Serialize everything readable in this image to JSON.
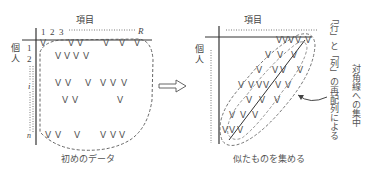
{
  "left_panel": {
    "column_axis_label": "項目",
    "row_axis_label_1": "個",
    "row_axis_label_2": "人",
    "column_numbers": [
      "1",
      "2",
      "3"
    ],
    "column_end": "R",
    "row_numbers": [
      "1",
      "2"
    ],
    "row_mid": "i",
    "row_end": "n",
    "caption": "初めのデータ",
    "marks": [
      {
        "x": 43,
        "y": 44
      },
      {
        "x": 71,
        "y": 44
      },
      {
        "x": 80,
        "y": 44
      },
      {
        "x": 106,
        "y": 44
      },
      {
        "x": 122,
        "y": 44
      },
      {
        "x": 137,
        "y": 44
      },
      {
        "x": 58,
        "y": 57
      },
      {
        "x": 67,
        "y": 57
      },
      {
        "x": 76,
        "y": 57
      },
      {
        "x": 86,
        "y": 57
      },
      {
        "x": 58,
        "y": 84
      },
      {
        "x": 68,
        "y": 84
      },
      {
        "x": 88,
        "y": 84
      },
      {
        "x": 103,
        "y": 84
      },
      {
        "x": 113,
        "y": 84
      },
      {
        "x": 124,
        "y": 84
      },
      {
        "x": 65,
        "y": 101
      },
      {
        "x": 75,
        "y": 101
      },
      {
        "x": 120,
        "y": 101
      },
      {
        "x": 48,
        "y": 136
      },
      {
        "x": 58,
        "y": 136
      },
      {
        "x": 77,
        "y": 136
      },
      {
        "x": 103,
        "y": 136
      },
      {
        "x": 113,
        "y": 136
      },
      {
        "x": 122,
        "y": 136
      }
    ]
  },
  "right_panel": {
    "column_axis_label": "項目",
    "row_axis_label_1": "個",
    "row_axis_label_2": "人",
    "caption": "似たものを集める",
    "annotation_col1": "「行」と「列」の再配列による",
    "annotation_col2": "対角線への集中",
    "marks": [
      {
        "x": 279,
        "y": 41
      },
      {
        "x": 285,
        "y": 41
      },
      {
        "x": 291,
        "y": 41
      },
      {
        "x": 298,
        "y": 41
      },
      {
        "x": 308,
        "y": 41
      },
      {
        "x": 268,
        "y": 56
      },
      {
        "x": 280,
        "y": 56
      },
      {
        "x": 294,
        "y": 56
      },
      {
        "x": 259,
        "y": 71
      },
      {
        "x": 275,
        "y": 71
      },
      {
        "x": 283,
        "y": 71
      },
      {
        "x": 300,
        "y": 71
      },
      {
        "x": 241,
        "y": 86
      },
      {
        "x": 251,
        "y": 86
      },
      {
        "x": 259,
        "y": 86
      },
      {
        "x": 266,
        "y": 86
      },
      {
        "x": 278,
        "y": 86
      },
      {
        "x": 288,
        "y": 86
      },
      {
        "x": 249,
        "y": 101
      },
      {
        "x": 262,
        "y": 101
      },
      {
        "x": 277,
        "y": 101
      },
      {
        "x": 232,
        "y": 116
      },
      {
        "x": 243,
        "y": 116
      },
      {
        "x": 255,
        "y": 116
      },
      {
        "x": 225,
        "y": 131
      },
      {
        "x": 232,
        "y": 131
      },
      {
        "x": 240,
        "y": 131
      }
    ]
  },
  "mark_glyph": "V",
  "arrow": "double-outline-right-arrow"
}
